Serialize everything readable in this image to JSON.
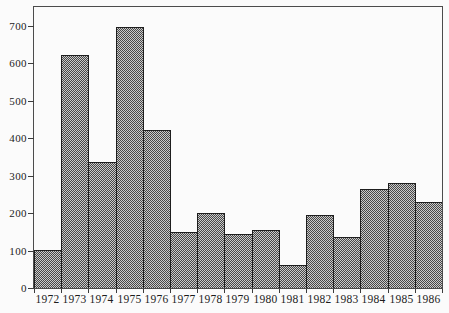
{
  "chart_data": {
    "type": "bar",
    "title": "",
    "subtitle": "",
    "xlabel": "",
    "ylabel": "",
    "categories": [
      "1972",
      "1973",
      "1974",
      "1975",
      "1976",
      "1977",
      "1978",
      "1979",
      "1980",
      "1981",
      "1982",
      "1983",
      "1984",
      "1985",
      "1986"
    ],
    "values": [
      100,
      620,
      335,
      695,
      420,
      150,
      200,
      145,
      155,
      60,
      195,
      135,
      265,
      280,
      230
    ],
    "ylim": [
      0,
      700
    ],
    "yticks": [
      0,
      100,
      200,
      300,
      400,
      500,
      600,
      700
    ],
    "ytick_labels": [
      "0",
      "100",
      "200",
      "300",
      "400",
      "500",
      "600",
      "700"
    ],
    "grid": false,
    "legend_visible": false,
    "bar_layout": "contiguous-histogram",
    "fill_pattern": "gray-checkerboard-halftone",
    "frame": "full-box",
    "colors": {
      "background": "#fbfbfb",
      "frame": "#4c4c4c",
      "bar_outline": "#1e1e1e",
      "bar_fill_dark": "#474747",
      "bar_fill_light": "#cacaca",
      "tick": "#3c3c3c",
      "label": "#1c1c1c"
    }
  }
}
